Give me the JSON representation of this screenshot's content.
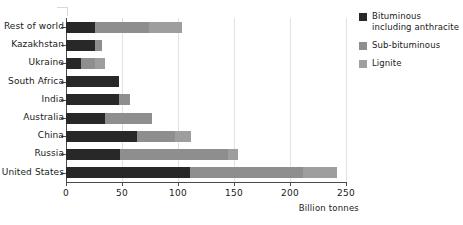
{
  "chart_data": {
    "type": "bar",
    "orientation": "horizontal",
    "stacked": true,
    "title": "",
    "subtitle": "",
    "xlabel": "Billion tonnes",
    "ylabel": "",
    "xlim": [
      0,
      250
    ],
    "xticks": [
      0,
      50,
      100,
      150,
      200,
      250
    ],
    "xtick_labels": [
      "0",
      "50",
      "100",
      "150",
      "200",
      "250"
    ],
    "grid": "vertical",
    "legend_position": "right",
    "categories": [
      "Rest of world",
      "Kazakhstan",
      "Ukraine",
      "South Africa",
      "India",
      "Australia",
      "China",
      "Russia",
      "United States"
    ],
    "series": [
      {
        "name": "Bituminous including anthracite",
        "color": "#282828",
        "values": [
          26,
          26,
          13,
          47,
          47,
          35,
          63,
          48,
          111
        ]
      },
      {
        "name": "Sub-bituminous",
        "color": "#8e8e8e",
        "values": [
          48,
          6,
          13,
          0,
          10,
          42,
          34,
          97,
          101
        ]
      },
      {
        "name": "Lignite",
        "color": "#9e9e9e",
        "values": [
          30,
          0,
          9,
          0,
          0,
          0,
          15,
          9,
          30
        ]
      }
    ],
    "totals": [
      104,
      32,
      35,
      47,
      57,
      77,
      112,
      154,
      242
    ]
  },
  "legend": {
    "items": [
      {
        "label": "Bituminous including anthracite",
        "color": "#282828"
      },
      {
        "label": "Sub-bituminous",
        "color": "#8e8e8e"
      },
      {
        "label": "Lignite",
        "color": "#9e9e9e"
      }
    ]
  },
  "axis": {
    "x_title": "Billion tonnes"
  }
}
